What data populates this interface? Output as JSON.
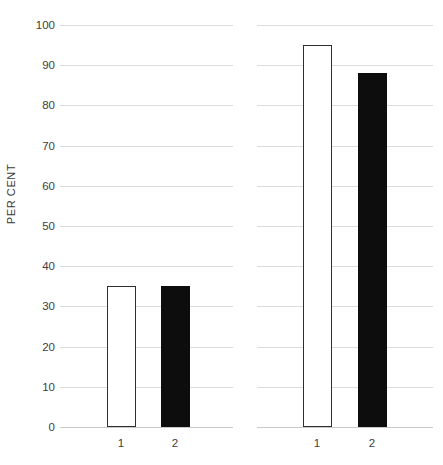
{
  "chart_data": {
    "type": "bar",
    "title": "",
    "subtitle": "",
    "xlabel": "",
    "ylabel": "PER CENT",
    "ylim": [
      0,
      100
    ],
    "ytick_values": [
      0,
      10,
      20,
      30,
      40,
      50,
      60,
      70,
      80,
      90,
      100
    ],
    "ytick_labels": [
      "0",
      "10",
      "20",
      "30",
      "40",
      "50",
      "60",
      "70",
      "80",
      "90",
      "100"
    ],
    "grid": true,
    "grid_axis": "y",
    "legend": false,
    "legend_position": "none",
    "panels": [
      {
        "name": "panel-left",
        "categories": [
          "1",
          "2"
        ],
        "values": [
          35,
          35
        ],
        "styles": [
          "open",
          "filled"
        ]
      },
      {
        "name": "panel-right",
        "categories": [
          "1",
          "2"
        ],
        "values": [
          95,
          88
        ],
        "styles": [
          "open",
          "filled"
        ]
      }
    ]
  },
  "colors": {
    "background": "#ffffff",
    "gridline": "#dcdcdc",
    "baseline": "#c9c9c9",
    "bar_open_fill": "#ffffff",
    "bar_open_stroke": "#2f2f2f",
    "bar_filled_fill": "#0d0d0d",
    "tick_text": "#3d3d3d",
    "axis_title_text": "#3a3a3a"
  }
}
